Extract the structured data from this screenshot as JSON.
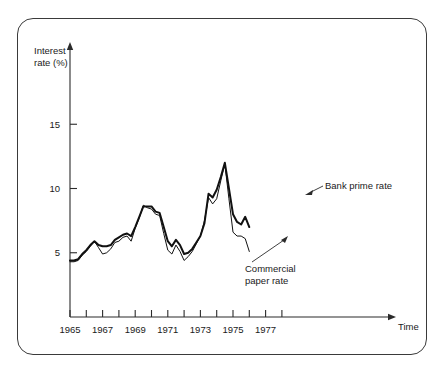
{
  "figure": {
    "background": "#ffffff",
    "frame_color": "#3a3a3a",
    "line_color": "#111111"
  },
  "axes": {
    "y_title_line1": "Interest",
    "y_title_line2": "rate (%)",
    "x_title": "Time",
    "y_ticks": [
      "5",
      "10",
      "15"
    ],
    "x_ticks_labeled": [
      "1965",
      "1967",
      "1969",
      "1971",
      "1973",
      "1975",
      "1977"
    ]
  },
  "annotations": {
    "bank": "Bank prime rate",
    "commercial_line1": "Commercial",
    "commercial_line2": "paper rate"
  },
  "chart_data": {
    "type": "line",
    "title": "",
    "xlabel": "Time",
    "ylabel": "Interest rate (%)",
    "xlim": [
      1965,
      1978.5
    ],
    "ylim": [
      0,
      17.5
    ],
    "grid": false,
    "legend_position": "inline-annotations",
    "x_tick_interval_years": 1,
    "x_tick_labels_every": 2,
    "y_tick_values": [
      5,
      10,
      15
    ],
    "series": [
      {
        "name": "Bank prime rate",
        "linewidth": "thick",
        "x": [
          1965.0,
          1965.25,
          1965.5,
          1965.75,
          1966.0,
          1966.25,
          1966.5,
          1966.75,
          1967.0,
          1967.25,
          1967.5,
          1967.75,
          1968.0,
          1968.25,
          1968.5,
          1968.75,
          1969.0,
          1969.25,
          1969.5,
          1969.75,
          1970.0,
          1970.25,
          1970.5,
          1970.75,
          1971.0,
          1971.25,
          1971.5,
          1971.75,
          1972.0,
          1972.25,
          1972.5,
          1972.75,
          1973.0,
          1973.25,
          1973.5,
          1973.75,
          1974.0,
          1974.25,
          1974.5,
          1974.75,
          1975.0,
          1975.25,
          1975.5,
          1975.75,
          1976.0
        ],
        "y": [
          4.4,
          4.4,
          4.5,
          4.9,
          5.2,
          5.6,
          5.9,
          5.6,
          5.5,
          5.5,
          5.6,
          6.0,
          6.2,
          6.4,
          6.5,
          6.3,
          7.0,
          7.8,
          8.6,
          8.6,
          8.6,
          8.2,
          8.1,
          7.0,
          5.9,
          5.5,
          6.0,
          5.6,
          4.9,
          5.0,
          5.3,
          5.8,
          6.3,
          7.3,
          9.6,
          9.3,
          9.9,
          10.9,
          12.0,
          10.0,
          8.0,
          7.4,
          7.2,
          7.8,
          7.0
        ],
        "peak_value": 12.0,
        "peak_year": 1974.5,
        "start_value": 4.4,
        "end_value": 7.0
      },
      {
        "name": "Commercial paper rate",
        "linewidth": "thin",
        "x": [
          1965.0,
          1965.25,
          1965.5,
          1965.75,
          1966.0,
          1966.25,
          1966.5,
          1966.75,
          1967.0,
          1967.25,
          1967.5,
          1967.75,
          1968.0,
          1968.25,
          1968.5,
          1968.75,
          1969.0,
          1969.25,
          1969.5,
          1969.75,
          1970.0,
          1970.25,
          1970.5,
          1970.75,
          1971.0,
          1971.25,
          1971.5,
          1971.75,
          1972.0,
          1972.25,
          1972.5,
          1972.75,
          1973.0,
          1973.25,
          1973.5,
          1973.75,
          1974.0,
          1974.25,
          1974.5,
          1974.75,
          1975.0,
          1975.25,
          1975.5,
          1975.75,
          1976.0
        ],
        "y": [
          4.3,
          4.3,
          4.4,
          4.8,
          5.1,
          5.5,
          5.9,
          5.4,
          4.9,
          5.0,
          5.3,
          5.8,
          5.9,
          6.2,
          6.3,
          5.9,
          6.9,
          7.7,
          8.7,
          8.5,
          8.4,
          8.0,
          7.9,
          6.5,
          5.2,
          4.9,
          5.6,
          5.1,
          4.4,
          4.7,
          5.1,
          5.7,
          6.3,
          7.5,
          9.3,
          8.8,
          9.2,
          10.6,
          11.9,
          9.2,
          6.6,
          6.3,
          6.3,
          6.1,
          5.1
        ],
        "peak_value": 11.9,
        "peak_year": 1974.5,
        "start_value": 4.3,
        "end_value": 5.1
      }
    ]
  }
}
